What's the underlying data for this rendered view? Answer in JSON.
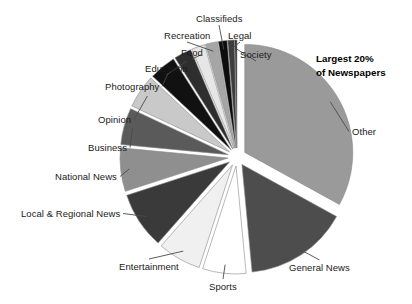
{
  "annotation": {
    "line1": "Largest 20%",
    "line2": "of Newspapers"
  },
  "chart_data": {
    "type": "pie",
    "title": "",
    "subtitle": "",
    "annotation": "Largest 20% of Newspapers",
    "legend_position": "callout-labels",
    "grid": false,
    "exploded": true,
    "start_angle_deg": 0,
    "direction": "clockwise",
    "center": {
      "x": 237,
      "y": 157
    },
    "radius": 108,
    "unit": "percent",
    "categories": [
      "Other",
      "General News",
      "Sports",
      "Entertainment",
      "Local & Regional News",
      "National News",
      "Business",
      "Opinion",
      "Photography",
      "Education",
      "Food",
      "Recreation",
      "Classifieds",
      "Legal",
      "Society"
    ],
    "values": [
      33.0,
      15.5,
      6.5,
      6.5,
      8.5,
      6.5,
      5.5,
      5.0,
      4.0,
      2.6,
      2.0,
      1.8,
      1.3,
      1.0,
      0.3
    ],
    "colors": [
      "#9a9a9a",
      "#4d4d4d",
      "#ffffff",
      "#f0f0f0",
      "#3a3a3a",
      "#8f8f8f",
      "#5a5a5a",
      "#c9c9c9",
      "#111111",
      "#2e2e2e",
      "#e6e6e6",
      "#a6a6a6",
      "#0d0d0d",
      "#3d3d3d",
      "#1f1f1f"
    ],
    "slices": [
      {
        "label": "Other",
        "value": 33.0,
        "color": "#9a9a9a"
      },
      {
        "label": "General News",
        "value": 15.5,
        "color": "#4d4d4d"
      },
      {
        "label": "Sports",
        "value": 6.5,
        "color": "#ffffff"
      },
      {
        "label": "Entertainment",
        "value": 6.5,
        "color": "#f0f0f0"
      },
      {
        "label": "Local & Regional News",
        "value": 8.5,
        "color": "#3a3a3a"
      },
      {
        "label": "National News",
        "value": 6.5,
        "color": "#8f8f8f"
      },
      {
        "label": "Business",
        "value": 5.5,
        "color": "#5a5a5a"
      },
      {
        "label": "Opinion",
        "value": 5.0,
        "color": "#c9c9c9"
      },
      {
        "label": "Photography",
        "value": 4.0,
        "color": "#111111"
      },
      {
        "label": "Education",
        "value": 2.6,
        "color": "#2e2e2e"
      },
      {
        "label": "Food",
        "value": 2.0,
        "color": "#e6e6e6"
      },
      {
        "label": "Recreation",
        "value": 1.8,
        "color": "#a6a6a6"
      },
      {
        "label": "Classifieds",
        "value": 1.3,
        "color": "#0d0d0d"
      },
      {
        "label": "Legal",
        "value": 1.0,
        "color": "#3d3d3d"
      },
      {
        "label": "Society",
        "value": 0.3,
        "color": "#1f1f1f"
      }
    ]
  },
  "labels": [
    {
      "key": "other",
      "text": "Other",
      "x": 352,
      "y": 126,
      "align": "left"
    },
    {
      "key": "general_news",
      "text": "General News",
      "x": 289,
      "y": 262,
      "align": "left"
    },
    {
      "key": "sports",
      "text": "Sports",
      "x": 209,
      "y": 281,
      "align": "left"
    },
    {
      "key": "entertainment",
      "text": "Entertainment",
      "x": 119,
      "y": 261,
      "align": "left"
    },
    {
      "key": "local_regional",
      "text": "Local & Regional News",
      "x": 21,
      "y": 208,
      "align": "left"
    },
    {
      "key": "national_news",
      "text": "National News",
      "x": 55,
      "y": 171,
      "align": "left"
    },
    {
      "key": "business",
      "text": "Business",
      "x": 88,
      "y": 142,
      "align": "left"
    },
    {
      "key": "opinion",
      "text": "Opinion",
      "x": 98,
      "y": 114,
      "align": "left"
    },
    {
      "key": "photography",
      "text": "Photography",
      "x": 105,
      "y": 81,
      "align": "left"
    },
    {
      "key": "education",
      "text": "Education",
      "x": 145,
      "y": 63,
      "align": "left"
    },
    {
      "key": "food",
      "text": "Food",
      "x": 181,
      "y": 47,
      "align": "left"
    },
    {
      "key": "recreation",
      "text": "Recreation",
      "x": 164,
      "y": 30,
      "align": "left"
    },
    {
      "key": "classifieds",
      "text": "Classifieds",
      "x": 196,
      "y": 13,
      "align": "left"
    },
    {
      "key": "legal",
      "text": "Legal",
      "x": 228,
      "y": 30,
      "align": "left"
    },
    {
      "key": "society",
      "text": "Society",
      "x": 240,
      "y": 49,
      "align": "left"
    }
  ]
}
